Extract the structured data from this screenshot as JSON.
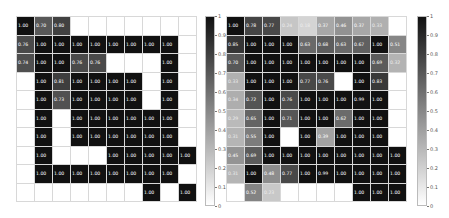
{
  "chart_data": [
    {
      "type": "heatmap",
      "title": "",
      "xlabel": "",
      "ylabel": "",
      "rows": 10,
      "cols": 10,
      "colormap": "gray_r",
      "vmin": 0,
      "vmax": 1,
      "colorbar_ticks": [
        "1",
        "0.9",
        "0.8",
        "0.7",
        "0.6",
        "0.5",
        "0.4",
        "0.3",
        "0.2",
        "0.1",
        "0"
      ],
      "values": [
        [
          1.0,
          0.7,
          0.8,
          null,
          null,
          null,
          null,
          null,
          null,
          null
        ],
        [
          0.76,
          1.0,
          1.0,
          1.0,
          1.0,
          1.0,
          1.0,
          1.0,
          1.0,
          null
        ],
        [
          0.74,
          1.0,
          1.0,
          0.76,
          0.76,
          null,
          null,
          null,
          1.0,
          null
        ],
        [
          null,
          1.0,
          0.81,
          1.0,
          1.0,
          1.0,
          1.0,
          null,
          1.0,
          null
        ],
        [
          null,
          1.0,
          0.73,
          1.0,
          1.0,
          1.0,
          1.0,
          null,
          1.0,
          null
        ],
        [
          null,
          1.0,
          null,
          1.0,
          1.0,
          1.0,
          1.0,
          1.0,
          1.0,
          null
        ],
        [
          null,
          1.0,
          null,
          1.0,
          1.0,
          1.0,
          1.0,
          1.0,
          1.0,
          null
        ],
        [
          null,
          1.0,
          null,
          null,
          null,
          1.0,
          1.0,
          1.0,
          1.0,
          1.0
        ],
        [
          null,
          1.0,
          1.0,
          1.0,
          1.0,
          1.0,
          1.0,
          1.0,
          1.0,
          null
        ],
        [
          null,
          null,
          null,
          null,
          null,
          null,
          null,
          1.0,
          null,
          1.0
        ]
      ]
    },
    {
      "type": "heatmap",
      "title": "",
      "xlabel": "",
      "ylabel": "",
      "rows": 10,
      "cols": 10,
      "colormap": "gray_r",
      "vmin": 0,
      "vmax": 1,
      "colorbar_ticks": [
        "1",
        "0.9",
        "0.8",
        "0.7",
        "0.6",
        "0.5",
        "0.4",
        "0.3",
        "0.2",
        "0.1",
        "0"
      ],
      "values": [
        [
          1.0,
          0.78,
          0.77,
          0.24,
          0.18,
          0.37,
          0.46,
          0.37,
          0.33,
          null
        ],
        [
          0.85,
          1.0,
          1.0,
          1.0,
          0.63,
          0.68,
          0.63,
          0.67,
          1.0,
          0.51
        ],
        [
          0.7,
          1.0,
          1.0,
          1.0,
          1.0,
          1.0,
          1.0,
          1.0,
          0.69,
          0.32
        ],
        [
          0.33,
          1.0,
          1.0,
          1.0,
          0.77,
          0.76,
          null,
          1.0,
          0.83,
          null
        ],
        [
          0.34,
          0.72,
          1.0,
          0.76,
          1.0,
          1.0,
          1.0,
          0.99,
          1.0,
          null
        ],
        [
          0.29,
          0.65,
          1.0,
          0.71,
          1.0,
          1.0,
          0.62,
          1.0,
          1.0,
          null
        ],
        [
          0.31,
          0.55,
          1.0,
          null,
          1.0,
          0.39,
          1.0,
          1.0,
          1.0,
          null
        ],
        [
          0.45,
          0.69,
          1.0,
          1.0,
          1.0,
          1.0,
          1.0,
          1.0,
          1.0,
          1.0
        ],
        [
          0.31,
          1.0,
          0.48,
          0.77,
          1.0,
          0.99,
          1.0,
          1.0,
          1.0,
          1.0
        ],
        [
          null,
          0.52,
          0.23,
          null,
          null,
          null,
          null,
          1.0,
          1.0,
          1.0
        ]
      ]
    }
  ]
}
